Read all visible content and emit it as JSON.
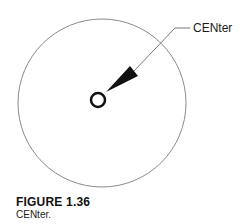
{
  "diagram": {
    "callout_label": "CENter",
    "colors": {
      "stroke": "#111111",
      "thin_stroke": "#777777",
      "background": "#ffffff"
    }
  },
  "figure": {
    "number": "FIGURE 1.36",
    "caption": "CENter."
  }
}
